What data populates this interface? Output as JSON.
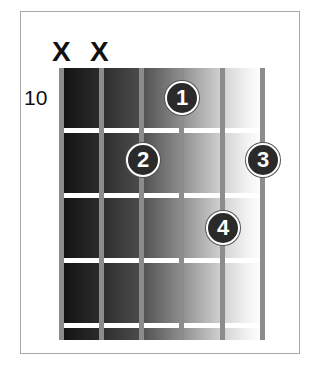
{
  "chord": {
    "start_fret": "10",
    "muted_strings": [
      {
        "string": 6,
        "label": "X"
      },
      {
        "string": 5,
        "label": "X"
      }
    ],
    "fingers": [
      {
        "finger": "1",
        "string": 3,
        "fret": 1
      },
      {
        "finger": "2",
        "string": 4,
        "fret": 2
      },
      {
        "finger": "3",
        "string": 1,
        "fret": 2
      },
      {
        "finger": "4",
        "string": 2,
        "fret": 3
      }
    ],
    "num_strings": 6,
    "num_frets_shown": 4
  },
  "colors": {
    "string": "#8c8c8c",
    "fret": "#ffffff",
    "finger_dot": "#2a2a2a",
    "border": "#a8a8a8"
  }
}
